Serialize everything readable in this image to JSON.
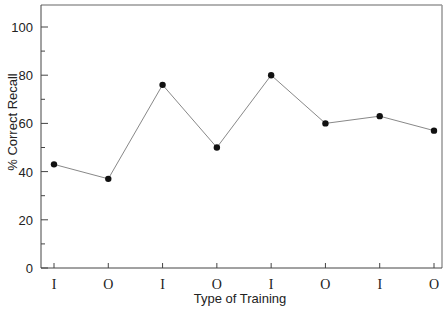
{
  "chart_data": {
    "type": "line",
    "title": "",
    "xlabel": "Type of Training",
    "ylabel": "% Correct Recall",
    "categories": [
      "I",
      "O",
      "I",
      "O",
      "I",
      "O",
      "I",
      "O"
    ],
    "series": [
      {
        "name": "% Correct Recall",
        "values": [
          43,
          37,
          76,
          50,
          80,
          60,
          63,
          57
        ]
      }
    ],
    "ylim": [
      0,
      110
    ],
    "yticks": [
      0,
      20,
      40,
      60,
      80,
      100
    ],
    "yminor_ticks": [
      10,
      30,
      50,
      70,
      90
    ],
    "grid": false,
    "legend": "none",
    "marker": "filled-circle",
    "colors": {
      "line": "#888888",
      "marker": "#111111",
      "axis": "#444444",
      "frame": "#888888"
    }
  }
}
